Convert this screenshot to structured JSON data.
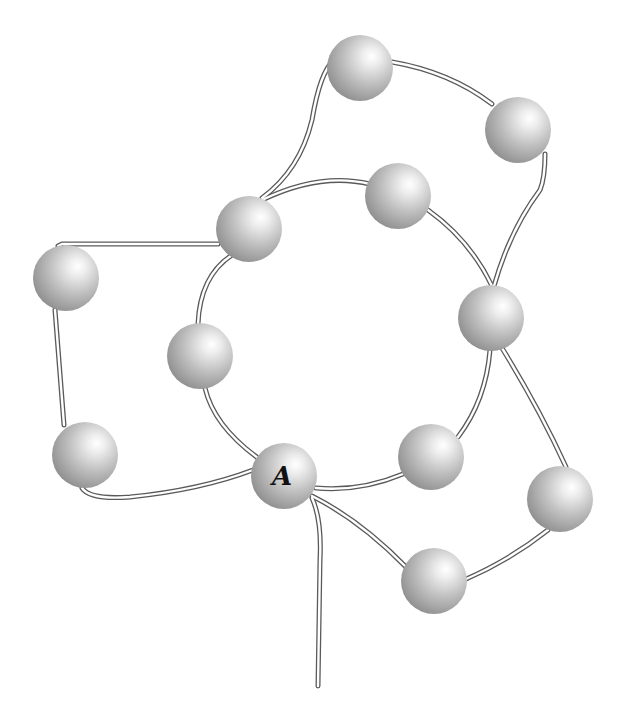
{
  "diagram": {
    "title": "",
    "type": "knot/bead network",
    "colors": {
      "background": "#ffffff",
      "bond_stroke": "#5a5a5a",
      "sphere_highlight": "#ffffff",
      "sphere_mid": "#c4c4c4",
      "sphere_shadow": "#8a8a8a",
      "label": "#111111"
    },
    "sphere_radius": 33,
    "nodes": [
      {
        "id": "n1",
        "x": 360,
        "y": 68,
        "label": ""
      },
      {
        "id": "n2",
        "x": 518,
        "y": 130,
        "label": ""
      },
      {
        "id": "n3",
        "x": 398,
        "y": 196,
        "label": ""
      },
      {
        "id": "n4",
        "x": 249,
        "y": 229,
        "label": ""
      },
      {
        "id": "n5",
        "x": 66,
        "y": 278,
        "label": ""
      },
      {
        "id": "n6",
        "x": 491,
        "y": 318,
        "label": ""
      },
      {
        "id": "n7",
        "x": 200,
        "y": 356,
        "label": ""
      },
      {
        "id": "n8",
        "x": 85,
        "y": 455,
        "label": ""
      },
      {
        "id": "n9",
        "x": 284,
        "y": 476,
        "label": "A"
      },
      {
        "id": "n10",
        "x": 431,
        "y": 457,
        "label": ""
      },
      {
        "id": "n11",
        "x": 560,
        "y": 499,
        "label": ""
      },
      {
        "id": "n12",
        "x": 434,
        "y": 581,
        "label": ""
      }
    ],
    "edges": [
      {
        "from": "n4",
        "to": "n3",
        "path": "M 262 200 Q 320 172 370 184"
      },
      {
        "from": "n3",
        "to": "n6",
        "path": "M 428 210 Q 470 240 492 286"
      },
      {
        "from": "n6",
        "to": "n10",
        "path": "M 490 350 Q 486 400 458 437"
      },
      {
        "from": "n10",
        "to": "n9",
        "path": "M 403 474 Q 360 492 316 488"
      },
      {
        "from": "n9",
        "to": "n7",
        "path": "M 258 458 Q 214 426 205 388"
      },
      {
        "from": "n7",
        "to": "n4",
        "path": "M 198 324 Q 200 276 232 255"
      },
      {
        "from": "n4",
        "to": "n1",
        "path": "M 262 198 Q 300 170 312 120 Q 320 72 334 60"
      },
      {
        "from": "n1",
        "to": "n2",
        "path": "M 392 62 Q 450 72 492 104"
      },
      {
        "from": "n2",
        "to": "n6",
        "path": "M 545 154 Q 545 178 540 190 Q 510 230 494 286"
      },
      {
        "from": "n4",
        "to": "n5",
        "path": "M 218 244 L 62 244 Q 60 245 58 246"
      },
      {
        "from": "n5",
        "to": "n8",
        "path": "M 55 310 L 64 425"
      },
      {
        "from": "n8",
        "to": "n9",
        "path": "M 82 488 Q 90 500 130 497 Q 200 490 253 470"
      },
      {
        "from": "n6",
        "to": "n11",
        "path": "M 502 348 Q 540 410 566 467"
      },
      {
        "from": "n11",
        "to": "n12",
        "path": "M 548 530 Q 510 560 464 580"
      },
      {
        "from": "n12",
        "to": "n9",
        "path": "M 406 567 Q 360 520 312 496"
      },
      {
        "from": "n9",
        "to": "tail",
        "path": "M 312 498 Q 322 520 320 560 L 318 686"
      }
    ],
    "labeled_node": {
      "id": "n9",
      "label": "A"
    }
  }
}
